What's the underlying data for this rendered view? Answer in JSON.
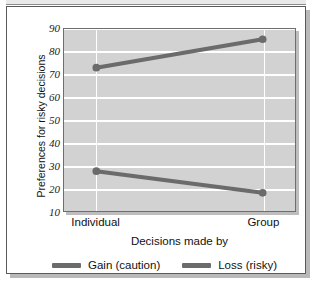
{
  "chart_data": {
    "type": "line",
    "title": "",
    "xlabel": "Decisions made by",
    "ylabel": "Preferences for risky decisions",
    "categories": [
      "Individual",
      "Group"
    ],
    "x": [
      0,
      1
    ],
    "ylim": [
      10,
      90
    ],
    "yticks": [
      90,
      80,
      70,
      60,
      50,
      40,
      30,
      20,
      10
    ],
    "ytick_labels": [
      "90",
      "80",
      "70",
      "60",
      "50",
      "40",
      "30",
      "20",
      "10"
    ],
    "grid": "horizontal-and-category-verticals",
    "legend_position": "bottom-center",
    "series": [
      {
        "name": "Gain (caution)",
        "values": [
          73,
          85.5
        ],
        "color": "#6b6b6b",
        "marker": "circle"
      },
      {
        "name": "Loss (risky)",
        "values": [
          27.5,
          18
        ],
        "color": "#6b6b6b",
        "marker": "circle"
      }
    ],
    "colors": {
      "plot_background": "#d2d2d2",
      "gridline": "#ffffff",
      "axis_border": "#6e6e6e",
      "text": "#111111",
      "series_gain": "#6b6b6b",
      "series_loss": "#6b6b6b",
      "card_border": "#5a5a5a",
      "card_background": "#ffffff"
    }
  },
  "legend": {
    "entries": [
      {
        "label": "Gain (caution)"
      },
      {
        "label": "Loss (risky)"
      }
    ]
  }
}
